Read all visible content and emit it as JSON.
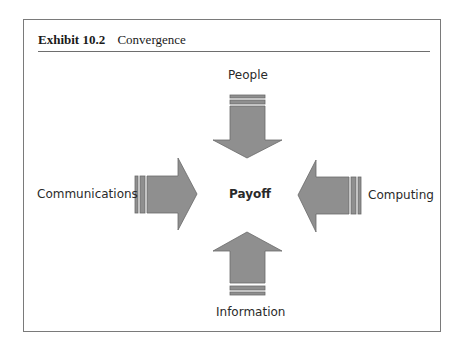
{
  "exhibit": {
    "number": "Exhibit 10.2",
    "title": "Convergence"
  },
  "diagram": {
    "center_label": "Payoff",
    "arrows": [
      {
        "id": "top",
        "label": "People",
        "direction": "down"
      },
      {
        "id": "left",
        "label": "Communications",
        "direction": "right"
      },
      {
        "id": "right",
        "label": "Computing",
        "direction": "left"
      },
      {
        "id": "bottom",
        "label": "Information",
        "direction": "up"
      }
    ],
    "colors": {
      "arrow_fill": "#8f8f8f",
      "arrow_stroke": "#6a6a6a",
      "frame": "#7a7a7a",
      "text": "#2a2a2a"
    }
  }
}
